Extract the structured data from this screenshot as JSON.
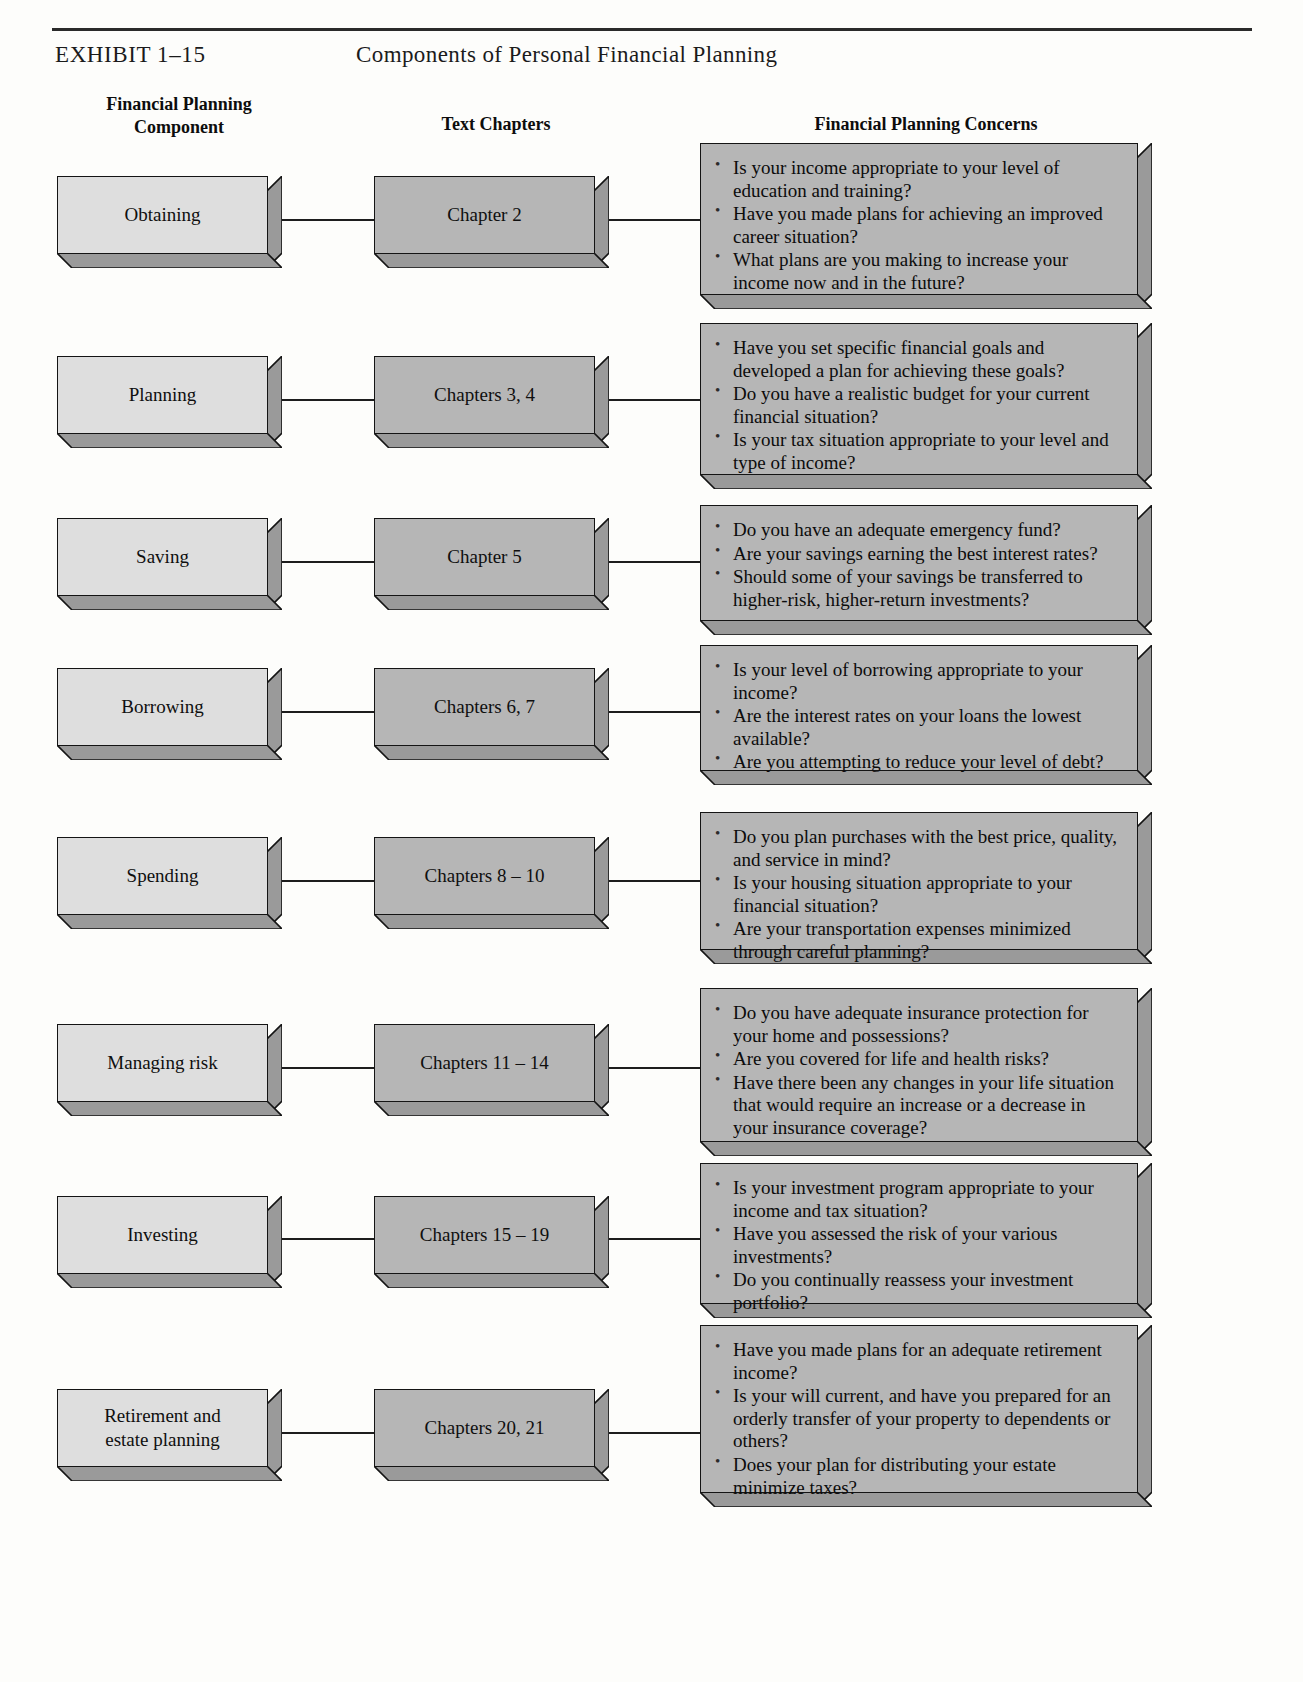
{
  "exhibit": {
    "label": "EXHIBIT 1–15",
    "title": "Components of Personal Financial Planning"
  },
  "columns": {
    "component": "Financial Planning\nComponent",
    "component_line1": "Financial Planning",
    "component_line2": "Component",
    "chapters": "Text Chapters",
    "concerns": "Financial Planning Concerns"
  },
  "colors": {
    "component_box_fill": "#dedede",
    "chapter_box_fill": "#b6b6b6",
    "concern_box_fill": "#b6b6b6",
    "box_outline": "#141414",
    "page_background": "#fdfdfb"
  },
  "rows": [
    {
      "component": "Obtaining",
      "chapters": "Chapter 2",
      "concerns": [
        "Is your income appropriate to your level of education and training?",
        "Have you made plans for achieving an improved career situation?",
        "What plans are you making to increase your income now and in the future?"
      ]
    },
    {
      "component": "Planning",
      "chapters": "Chapters 3, 4",
      "concerns": [
        "Have you set specific financial goals and developed a plan for achieving these goals?",
        "Do you have a realistic budget for your current financial situation?",
        "Is your tax situation appropriate to your level and type of income?"
      ]
    },
    {
      "component": "Saving",
      "chapters": "Chapter 5",
      "concerns": [
        "Do you have an adequate emergency fund?",
        "Are your savings earning the best interest rates?",
        "Should some of your savings be transferred to higher-risk, higher-return investments?"
      ]
    },
    {
      "component": "Borrowing",
      "chapters": "Chapters 6, 7",
      "concerns": [
        "Is your level of borrowing appropriate to your income?",
        "Are the interest rates on your loans the lowest available?",
        "Are you attempting to reduce your level of debt?"
      ]
    },
    {
      "component": "Spending",
      "chapters": "Chapters 8 – 10",
      "concerns": [
        "Do you plan purchases with the best price, quality, and service in mind?",
        "Is your housing situation appropriate to your financial situation?",
        "Are your transportation expenses minimized through careful planning?"
      ]
    },
    {
      "component": "Managing risk",
      "chapters": "Chapters 11 – 14",
      "concerns": [
        "Do you have adequate insurance protection for your home and possessions?",
        "Are you covered for life and health risks?",
        "Have there been any changes in your life situation that would require an increase or a decrease in your insurance coverage?"
      ]
    },
    {
      "component": "Investing",
      "chapters": "Chapters 15 – 19",
      "concerns": [
        "Is your investment program appropriate to your income and tax situation?",
        "Have you assessed the risk of your various investments?",
        "Do you continually reassess your investment portfolio?"
      ]
    },
    {
      "component": "Retirement and\nestate planning",
      "chapters": "Chapters 20, 21",
      "concerns": [
        "Have you made plans for an adequate retirement income?",
        "Is your will current, and have you prepared for an orderly transfer of your property to dependents or others?",
        "Does your plan for distributing your estate minimize taxes?"
      ]
    }
  ],
  "layout": {
    "rows_geometry": [
      {
        "comp_top": 176,
        "comp_h": 92,
        "chap_top": 176,
        "chap_h": 92,
        "conc_top": 143,
        "conc_h": 166,
        "line_y": 219
      },
      {
        "comp_top": 356,
        "comp_h": 92,
        "chap_top": 356,
        "chap_h": 92,
        "conc_top": 323,
        "conc_h": 166,
        "line_y": 399
      },
      {
        "comp_top": 518,
        "comp_h": 92,
        "chap_top": 518,
        "chap_h": 92,
        "conc_top": 505,
        "conc_h": 130,
        "line_y": 561
      },
      {
        "comp_top": 668,
        "comp_h": 92,
        "chap_top": 668,
        "chap_h": 92,
        "conc_top": 645,
        "conc_h": 140,
        "line_y": 711
      },
      {
        "comp_top": 837,
        "comp_h": 92,
        "chap_top": 837,
        "chap_h": 92,
        "conc_top": 812,
        "conc_h": 152,
        "line_y": 880
      },
      {
        "comp_top": 1024,
        "comp_h": 92,
        "chap_top": 1024,
        "chap_h": 92,
        "conc_top": 988,
        "conc_h": 168,
        "line_y": 1067
      },
      {
        "comp_top": 1196,
        "comp_h": 92,
        "chap_top": 1196,
        "chap_h": 92,
        "conc_top": 1163,
        "conc_h": 155,
        "line_y": 1238
      },
      {
        "comp_top": 1389,
        "comp_h": 92,
        "chap_top": 1389,
        "chap_h": 92,
        "conc_top": 1325,
        "conc_h": 182,
        "line_y": 1432
      }
    ]
  }
}
